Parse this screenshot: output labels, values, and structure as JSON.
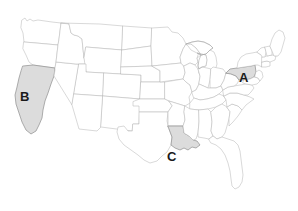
{
  "map": {
    "title": "United States map with three highlighted states",
    "projection": "albers-usa",
    "background_color": "#ffffff",
    "state_fill_color": "#ffffff",
    "state_border_color": "#b9b9b9",
    "highlight_fill_color": "#dcdcdc",
    "highlight_border_color": "#8e8e8e",
    "label_color": "#1a1a1a",
    "labels": [
      {
        "text": "A",
        "state": "Pennsylvania",
        "x": 239,
        "y": 71
      },
      {
        "text": "B",
        "state": "California",
        "x": 20,
        "y": 90
      },
      {
        "text": "C",
        "state": "Louisiana",
        "x": 167,
        "y": 150
      }
    ],
    "highlighted_states": [
      "Pennsylvania",
      "California",
      "Louisiana"
    ],
    "region_counts": {
      "highlighted": 3,
      "total_visible": 49
    }
  }
}
